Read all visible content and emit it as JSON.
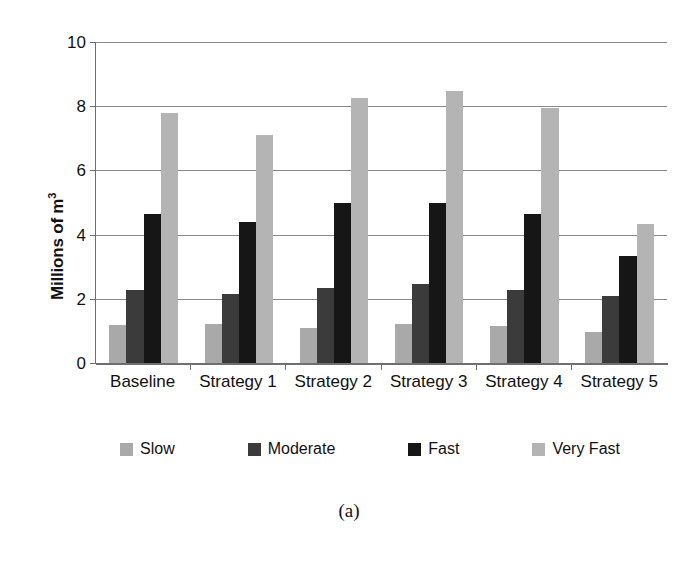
{
  "chart_data": {
    "type": "bar",
    "title": "",
    "xlabel": "",
    "ylabel": "Millions of m",
    "ylabel_sup": "3",
    "categories": [
      "Baseline",
      "Strategy 1",
      "Strategy 2",
      "Strategy 3",
      "Strategy 4",
      "Strategy 5"
    ],
    "series": [
      {
        "name": "Slow",
        "color": "#a9a9a9",
        "values": [
          1.18,
          1.22,
          1.1,
          1.22,
          1.15,
          0.97
        ]
      },
      {
        "name": "Moderate",
        "color": "#3b3b3b",
        "values": [
          2.27,
          2.15,
          2.33,
          2.47,
          2.27,
          2.08
        ]
      },
      {
        "name": "Fast",
        "color": "#161616",
        "values": [
          4.65,
          4.4,
          5.0,
          5.0,
          4.65,
          3.32
        ]
      },
      {
        "name": "Very Fast",
        "color": "#b4b4b4",
        "values": [
          7.8,
          7.1,
          8.27,
          8.48,
          7.95,
          4.33
        ]
      }
    ],
    "ylim": [
      0,
      10
    ],
    "yticks": [
      0,
      2,
      4,
      6,
      8,
      10
    ],
    "ytick_labels": [
      "0",
      "2",
      "4",
      "6",
      "8",
      "10"
    ],
    "grid": true,
    "legend_position": "bottom"
  },
  "caption": "(a)"
}
